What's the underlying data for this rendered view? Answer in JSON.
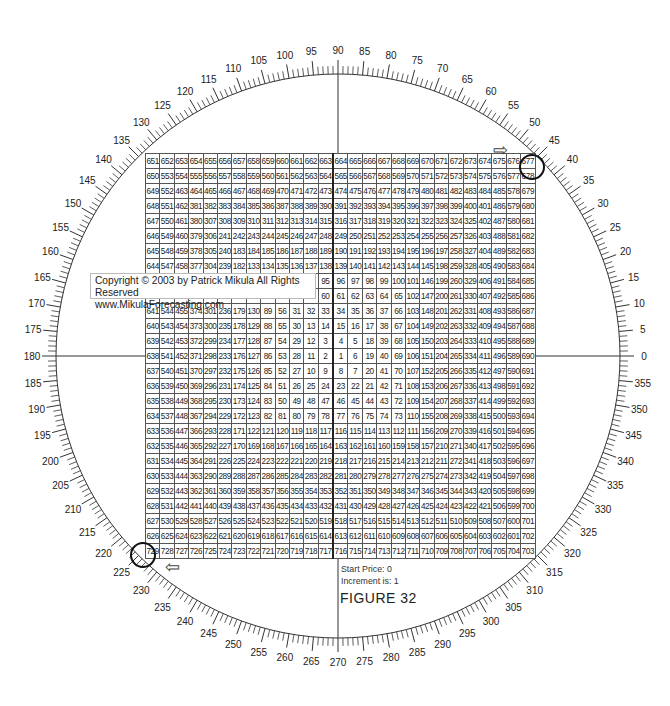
{
  "figure_title": "FIGURE  32",
  "start_price_label": "Start Price: 0",
  "increment_label": "Increment is: 1",
  "copyright": {
    "line1": "Copyright © 2003 by Patrick Mikula All Rights Reserved",
    "line2": "www.MikulaForecasting.com"
  },
  "wheel": {
    "center": [
      338,
      356
    ],
    "radius": 282,
    "degree_labels_step": 5,
    "minor_tick_step": 1,
    "start_angle_label": 0,
    "direction": "counterclockwise",
    "labels": [
      "0",
      "5",
      "10",
      "15",
      "20",
      "25",
      "30",
      "35",
      "40",
      "45",
      "50",
      "55",
      "60",
      "65",
      "70",
      "75",
      "80",
      "85",
      "90",
      "95",
      "100",
      "105",
      "110",
      "115",
      "120",
      "125",
      "130",
      "135",
      "140",
      "145",
      "150",
      "155",
      "160",
      "165",
      "170",
      "175",
      "180",
      "185",
      "190",
      "195",
      "200",
      "205",
      "210",
      "215",
      "220",
      "225",
      "230",
      "235",
      "240",
      "245",
      "250",
      "255",
      "260",
      "265",
      "270",
      "275",
      "280",
      "285",
      "290",
      "295",
      "300",
      "305",
      "310",
      "315",
      "320",
      "325",
      "330",
      "335",
      "340",
      "345",
      "350",
      "355"
    ]
  },
  "markers": {
    "circled_top_right": "677",
    "circled_bottom_left": "729",
    "arrow_top": "⇨",
    "arrow_bottom": "⇦"
  },
  "grid": {
    "cols": 27,
    "center_value": "1",
    "rows": [
      [
        "651",
        "652",
        "653",
        "654",
        "655",
        "656",
        "657",
        "658",
        "659",
        "660",
        "661",
        "662",
        "663",
        "664",
        "665",
        "666",
        "667",
        "668",
        "669",
        "670",
        "671",
        "672",
        "673",
        "674",
        "675",
        "676",
        "677"
      ],
      [
        "650",
        "553",
        "554",
        "555",
        "556",
        "557",
        "558",
        "559",
        "560",
        "561",
        "562",
        "563",
        "564",
        "565",
        "566",
        "567",
        "568",
        "569",
        "570",
        "571",
        "572",
        "573",
        "574",
        "575",
        "576",
        "577",
        "678"
      ],
      [
        "649",
        "552",
        "463",
        "464",
        "465",
        "466",
        "467",
        "468",
        "469",
        "470",
        "471",
        "472",
        "473",
        "474",
        "475",
        "476",
        "477",
        "478",
        "479",
        "480",
        "481",
        "482",
        "483",
        "484",
        "485",
        "578",
        "679"
      ],
      [
        "648",
        "551",
        "462",
        "381",
        "382",
        "383",
        "384",
        "385",
        "386",
        "387",
        "388",
        "389",
        "390",
        "391",
        "392",
        "393",
        "394",
        "395",
        "396",
        "397",
        "398",
        "399",
        "400",
        "401",
        "486",
        "579",
        "680"
      ],
      [
        "647",
        "550",
        "461",
        "380",
        "307",
        "308",
        "309",
        "310",
        "311",
        "312",
        "313",
        "314",
        "315",
        "316",
        "317",
        "318",
        "319",
        "320",
        "321",
        "322",
        "323",
        "324",
        "325",
        "402",
        "487",
        "580",
        "681"
      ],
      [
        "646",
        "549",
        "460",
        "379",
        "306",
        "241",
        "242",
        "243",
        "244",
        "245",
        "246",
        "247",
        "248",
        "249",
        "250",
        "251",
        "252",
        "253",
        "254",
        "255",
        "256",
        "257",
        "326",
        "403",
        "488",
        "581",
        "682"
      ],
      [
        "645",
        "548",
        "459",
        "378",
        "305",
        "240",
        "183",
        "184",
        "185",
        "186",
        "187",
        "188",
        "189",
        "190",
        "191",
        "192",
        "193",
        "194",
        "195",
        "196",
        "197",
        "258",
        "327",
        "404",
        "489",
        "582",
        "683"
      ],
      [
        "644",
        "547",
        "458",
        "377",
        "304",
        "239",
        "182",
        "133",
        "134",
        "135",
        "136",
        "137",
        "138",
        "139",
        "140",
        "141",
        "142",
        "143",
        "144",
        "145",
        "198",
        "259",
        "328",
        "405",
        "490",
        "583",
        "684"
      ],
      [
        "643",
        "546",
        "457",
        "376",
        "303",
        "238",
        "181",
        "132",
        "91",
        "92",
        "93",
        "94",
        "95",
        "96",
        "97",
        "98",
        "99",
        "100",
        "101",
        "146",
        "199",
        "260",
        "329",
        "406",
        "491",
        "584",
        "685"
      ],
      [
        "642",
        "545",
        "456",
        "375",
        "302",
        "237",
        "180",
        "131",
        "90",
        "57",
        "58",
        "59",
        "60",
        "61",
        "62",
        "63",
        "64",
        "65",
        "102",
        "147",
        "200",
        "261",
        "330",
        "407",
        "492",
        "585",
        "686"
      ],
      [
        "641",
        "544",
        "455",
        "374",
        "301",
        "236",
        "179",
        "130",
        "89",
        "56",
        "31",
        "32",
        "33",
        "34",
        "35",
        "36",
        "37",
        "66",
        "103",
        "148",
        "201",
        "262",
        "331",
        "408",
        "493",
        "586",
        "687"
      ],
      [
        "640",
        "543",
        "454",
        "373",
        "300",
        "235",
        "178",
        "129",
        "88",
        "55",
        "30",
        "13",
        "14",
        "15",
        "16",
        "17",
        "38",
        "67",
        "104",
        "149",
        "202",
        "263",
        "332",
        "409",
        "494",
        "587",
        "688"
      ],
      [
        "639",
        "542",
        "453",
        "372",
        "299",
        "234",
        "177",
        "128",
        "87",
        "54",
        "29",
        "12",
        "3",
        "4",
        "5",
        "18",
        "39",
        "68",
        "105",
        "150",
        "203",
        "264",
        "333",
        "410",
        "495",
        "588",
        "689"
      ],
      [
        "638",
        "541",
        "452",
        "371",
        "298",
        "233",
        "176",
        "127",
        "86",
        "53",
        "28",
        "11",
        "2",
        "1",
        "6",
        "19",
        "40",
        "69",
        "106",
        "151",
        "204",
        "265",
        "334",
        "411",
        "496",
        "589",
        "690"
      ],
      [
        "637",
        "540",
        "451",
        "370",
        "297",
        "232",
        "175",
        "126",
        "85",
        "52",
        "27",
        "10",
        "9",
        "8",
        "7",
        "20",
        "41",
        "70",
        "107",
        "152",
        "205",
        "266",
        "335",
        "412",
        "497",
        "590",
        "691"
      ],
      [
        "636",
        "539",
        "450",
        "369",
        "296",
        "231",
        "174",
        "125",
        "84",
        "51",
        "26",
        "25",
        "24",
        "23",
        "22",
        "21",
        "42",
        "71",
        "108",
        "153",
        "206",
        "267",
        "336",
        "413",
        "498",
        "591",
        "692"
      ],
      [
        "635",
        "538",
        "449",
        "368",
        "295",
        "230",
        "173",
        "124",
        "83",
        "50",
        "49",
        "48",
        "47",
        "46",
        "45",
        "44",
        "43",
        "72",
        "109",
        "154",
        "207",
        "268",
        "337",
        "414",
        "499",
        "592",
        "693"
      ],
      [
        "634",
        "537",
        "448",
        "367",
        "294",
        "229",
        "172",
        "123",
        "82",
        "81",
        "80",
        "79",
        "78",
        "77",
        "76",
        "75",
        "74",
        "73",
        "110",
        "155",
        "208",
        "269",
        "338",
        "415",
        "500",
        "593",
        "694"
      ],
      [
        "633",
        "536",
        "447",
        "366",
        "293",
        "228",
        "171",
        "122",
        "121",
        "120",
        "119",
        "118",
        "117",
        "116",
        "115",
        "114",
        "113",
        "112",
        "111",
        "156",
        "209",
        "270",
        "339",
        "416",
        "501",
        "594",
        "695"
      ],
      [
        "632",
        "535",
        "446",
        "365",
        "292",
        "227",
        "170",
        "169",
        "168",
        "167",
        "166",
        "165",
        "164",
        "163",
        "162",
        "161",
        "160",
        "159",
        "158",
        "157",
        "210",
        "271",
        "340",
        "417",
        "502",
        "595",
        "696"
      ],
      [
        "631",
        "534",
        "445",
        "364",
        "291",
        "226",
        "225",
        "224",
        "223",
        "222",
        "221",
        "220",
        "219",
        "218",
        "217",
        "216",
        "215",
        "214",
        "213",
        "212",
        "211",
        "272",
        "341",
        "418",
        "503",
        "596",
        "697"
      ],
      [
        "630",
        "533",
        "444",
        "363",
        "290",
        "289",
        "288",
        "287",
        "286",
        "285",
        "284",
        "283",
        "282",
        "281",
        "280",
        "279",
        "278",
        "277",
        "276",
        "275",
        "274",
        "273",
        "342",
        "419",
        "504",
        "597",
        "698"
      ],
      [
        "629",
        "532",
        "443",
        "362",
        "361",
        "360",
        "359",
        "358",
        "357",
        "356",
        "355",
        "354",
        "353",
        "352",
        "351",
        "350",
        "349",
        "348",
        "347",
        "346",
        "345",
        "344",
        "343",
        "420",
        "505",
        "598",
        "699"
      ],
      [
        "628",
        "531",
        "442",
        "441",
        "440",
        "439",
        "438",
        "437",
        "436",
        "435",
        "434",
        "433",
        "432",
        "431",
        "430",
        "429",
        "428",
        "427",
        "426",
        "425",
        "424",
        "423",
        "422",
        "421",
        "506",
        "599",
        "700"
      ],
      [
        "627",
        "530",
        "529",
        "528",
        "527",
        "526",
        "525",
        "524",
        "523",
        "522",
        "521",
        "520",
        "519",
        "518",
        "517",
        "516",
        "515",
        "514",
        "513",
        "512",
        "511",
        "510",
        "509",
        "508",
        "507",
        "600",
        "701"
      ],
      [
        "626",
        "625",
        "624",
        "623",
        "622",
        "621",
        "620",
        "619",
        "618",
        "617",
        "616",
        "615",
        "614",
        "613",
        "612",
        "611",
        "610",
        "609",
        "608",
        "607",
        "606",
        "605",
        "604",
        "603",
        "602",
        "601",
        "702"
      ],
      [
        "729",
        "728",
        "727",
        "726",
        "725",
        "724",
        "723",
        "722",
        "721",
        "720",
        "719",
        "718",
        "717",
        "716",
        "715",
        "714",
        "713",
        "712",
        "711",
        "710",
        "709",
        "708",
        "707",
        "706",
        "705",
        "704",
        "703"
      ]
    ]
  }
}
